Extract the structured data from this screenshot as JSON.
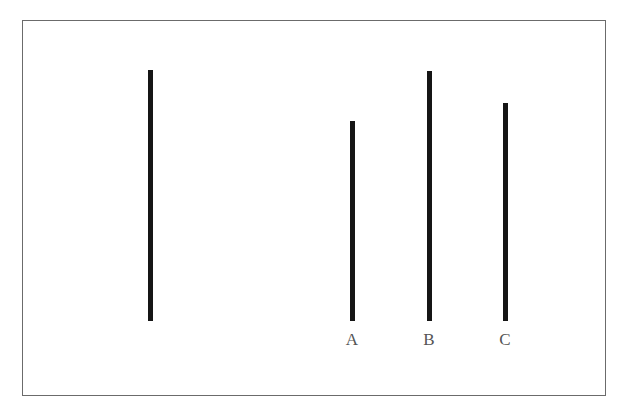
{
  "figure": {
    "border_color": "#6b6b6b",
    "line_color": "#151515",
    "label_color": "#555555"
  },
  "standard_line": {
    "label": "",
    "x": 150,
    "top": 70,
    "bottom": 321
  },
  "comparison_lines": [
    {
      "label": "A",
      "x": 352,
      "top": 121,
      "bottom": 321
    },
    {
      "label": "B",
      "x": 429,
      "top": 71,
      "bottom": 321
    },
    {
      "label": "C",
      "x": 505,
      "top": 103,
      "bottom": 321
    }
  ]
}
